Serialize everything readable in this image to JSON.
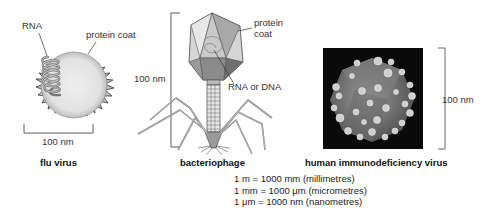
{
  "flu_virus": {
    "caption": "flu virus",
    "labels": {
      "rna": "RNA",
      "protein_coat": "protein coat"
    },
    "scale": "100 nm"
  },
  "bacteriophage": {
    "caption": "bacteriophage",
    "labels": {
      "protein_coat_line1": "protein",
      "protein_coat_line2": "coat",
      "genome": "RNA or DNA"
    },
    "scale": "100 nm"
  },
  "hiv": {
    "caption": "human immunodeficiency virus",
    "scale": "100 nm"
  },
  "conversions": [
    "1 m = 1000 mm (millimetres)",
    "1 mm = 1000 μm (micrometres)",
    "1 μm = 1000 nm (nanometres)"
  ]
}
